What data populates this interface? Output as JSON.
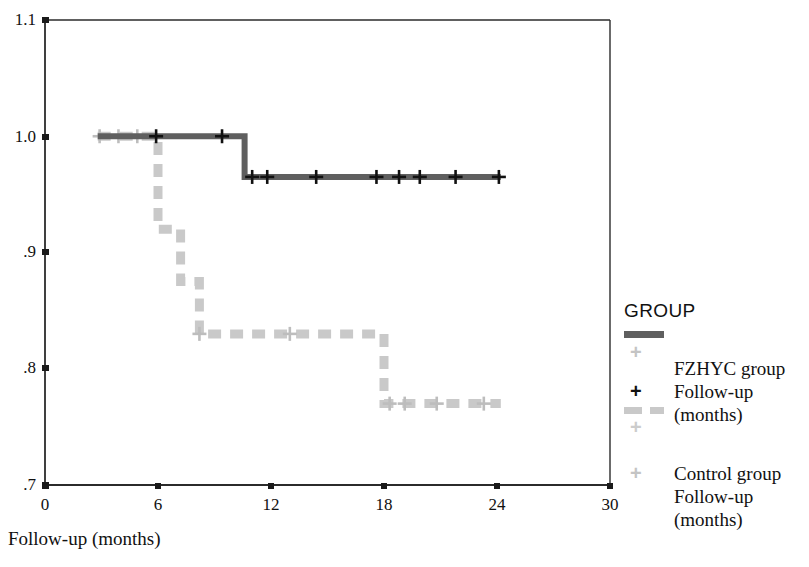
{
  "chart_data": {
    "type": "line",
    "subtype": "kaplan-meier-step",
    "title": "",
    "xlabel": "Follow-up (months)",
    "ylabel": "",
    "xlim": [
      0,
      30
    ],
    "ylim": [
      0.7,
      1.1
    ],
    "xticks": [
      "0",
      "6",
      "12",
      "18",
      "24",
      "30"
    ],
    "xtick_values": [
      0,
      6,
      12,
      18,
      24,
      30
    ],
    "yticks": [
      "1.1",
      "1.0",
      ".9",
      ".8",
      ".7"
    ],
    "ytick_values": [
      1.1,
      1.0,
      0.9,
      0.8,
      0.7
    ],
    "grid": false,
    "legend_position": "right",
    "series": [
      {
        "name": "FZHYC group",
        "color": "#5f5f5f",
        "linestyle": "solid",
        "marker": "plus",
        "marker_color": "#111111",
        "steps": [
          {
            "x": 2.8,
            "y": 1.0
          },
          {
            "x": 10.6,
            "y": 1.0
          },
          {
            "x": 10.6,
            "y": 0.965
          },
          {
            "x": 24.2,
            "y": 0.965
          }
        ],
        "censored": [
          {
            "x": 5.9,
            "y": 1.0
          },
          {
            "x": 9.4,
            "y": 1.0
          },
          {
            "x": 11.0,
            "y": 0.965
          },
          {
            "x": 11.8,
            "y": 0.965
          },
          {
            "x": 14.4,
            "y": 0.965
          },
          {
            "x": 17.6,
            "y": 0.965
          },
          {
            "x": 18.8,
            "y": 0.965
          },
          {
            "x": 19.9,
            "y": 0.965
          },
          {
            "x": 21.8,
            "y": 0.965
          },
          {
            "x": 24.1,
            "y": 0.965
          }
        ]
      },
      {
        "name": "Control group",
        "color": "#c9c9c9",
        "linestyle": "dashed",
        "marker": "plus",
        "marker_color": "#bdbdbd",
        "steps": [
          {
            "x": 2.8,
            "y": 1.0
          },
          {
            "x": 6.0,
            "y": 1.0
          },
          {
            "x": 6.0,
            "y": 0.92
          },
          {
            "x": 7.2,
            "y": 0.92
          },
          {
            "x": 7.2,
            "y": 0.875
          },
          {
            "x": 8.2,
            "y": 0.875
          },
          {
            "x": 8.2,
            "y": 0.83
          },
          {
            "x": 18.0,
            "y": 0.83
          },
          {
            "x": 18.0,
            "y": 0.77
          },
          {
            "x": 24.2,
            "y": 0.77
          }
        ],
        "censored": [
          {
            "x": 2.9,
            "y": 1.0
          },
          {
            "x": 3.9,
            "y": 1.0
          },
          {
            "x": 4.9,
            "y": 1.0
          },
          {
            "x": 8.2,
            "y": 0.83
          },
          {
            "x": 13.0,
            "y": 0.83
          },
          {
            "x": 18.3,
            "y": 0.77
          },
          {
            "x": 19.1,
            "y": 0.77
          },
          {
            "x": 20.8,
            "y": 0.77
          },
          {
            "x": 23.3,
            "y": 0.77
          }
        ]
      }
    ]
  },
  "legend": {
    "title": "GROUP",
    "entries": [
      {
        "symbol": "solid-dark-line",
        "lines": [
          "FZHYC group",
          "Follow-up",
          "(months)"
        ]
      },
      {
        "symbol": "dashed-gray-line",
        "lines": [
          "Control group",
          "Follow-up",
          "(months)"
        ]
      }
    ],
    "plus_marks": [
      "+",
      "+",
      "+",
      "+"
    ]
  },
  "axes": {
    "x_title": "Follow-up (months)"
  }
}
